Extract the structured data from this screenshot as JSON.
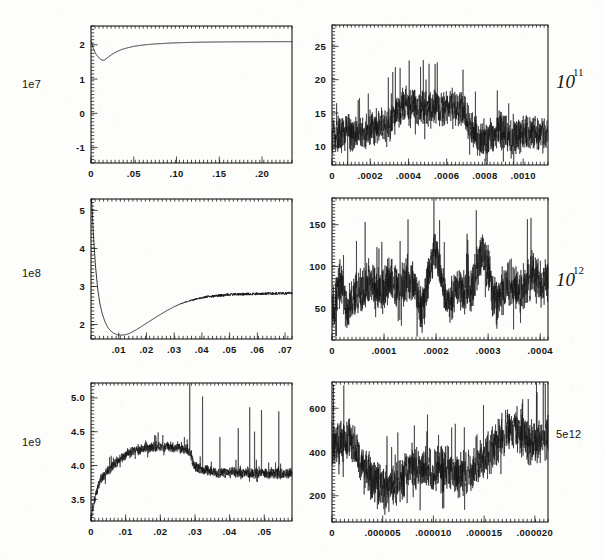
{
  "figure": {
    "background_color": "#fdfdfb",
    "ink_color": "#151515",
    "width": 605,
    "height": 560,
    "panel_count": 6,
    "layout": "3 rows x 2 columns"
  },
  "chart_data": [
    {
      "id": "panel-top-left",
      "type": "line",
      "title": "",
      "xlabel": "",
      "ylabel": "",
      "y_scale_label": "1e7",
      "scale_label_style": "plain",
      "xlim": [
        0,
        0.235
      ],
      "ylim": [
        -1.45,
        2.55
      ],
      "xticks": [
        0,
        0.05,
        0.1,
        0.15,
        0.2
      ],
      "xticklabels": [
        "0",
        ".05",
        ".10",
        ".15",
        ".20"
      ],
      "yticks": [
        -1,
        0,
        1,
        2
      ],
      "yticklabels": [
        "-1",
        "0",
        "1",
        "2"
      ],
      "x_minor_tick_count": 50,
      "y_minor_tick_count": 40,
      "grid": false,
      "legend": false,
      "noise_amplitude": 0.0,
      "x": [
        0.0,
        0.0015,
        0.003,
        0.005,
        0.007,
        0.009,
        0.011,
        0.013,
        0.0145,
        0.016,
        0.018,
        0.021,
        0.025,
        0.03,
        0.036,
        0.043,
        0.05,
        0.058,
        0.067,
        0.077,
        0.088,
        0.1,
        0.115,
        0.13,
        0.15,
        0.17,
        0.19,
        0.21,
        0.225,
        0.235
      ],
      "y": [
        2.12,
        2.0,
        1.88,
        1.76,
        1.69,
        1.63,
        1.58,
        1.555,
        1.55,
        1.56,
        1.6,
        1.66,
        1.73,
        1.8,
        1.865,
        1.915,
        1.955,
        1.985,
        2.01,
        2.03,
        2.045,
        2.06,
        2.07,
        2.078,
        2.084,
        2.088,
        2.09,
        2.092,
        2.093,
        2.094
      ]
    },
    {
      "id": "panel-top-right",
      "type": "line",
      "title": "",
      "xlabel": "",
      "ylabel": "",
      "y_scale_label": "10",
      "y_scale_exponent": "11",
      "scale_label_style": "handwritten-power",
      "xlim": [
        0,
        0.00113
      ],
      "ylim": [
        7.2,
        28.2
      ],
      "xticks": [
        0,
        0.0002,
        0.0004,
        0.0006,
        0.0008,
        0.001
      ],
      "xticklabels": [
        "0",
        ".0002",
        ".0004",
        ".0006",
        ".0008",
        ".0010"
      ],
      "yticks": [
        10,
        15,
        20,
        25
      ],
      "yticklabels": [
        "10",
        "15",
        "20",
        "25"
      ],
      "x_minor_tick_count": 56,
      "y_minor_tick_count": 42,
      "grid": false,
      "legend": false,
      "noise_amplitude": 2.6,
      "envelope_x": [
        0.0,
        5e-05,
        0.0001,
        0.00015,
        0.0002,
        0.00025,
        0.0003,
        0.00034,
        0.00038,
        0.00042,
        0.00048,
        0.00055,
        0.00062,
        0.00068,
        0.00072,
        0.00076,
        0.0008,
        0.00084,
        0.00088,
        0.00092,
        0.00096,
        0.001,
        0.00105,
        0.00113
      ],
      "envelope_y": [
        11.4,
        11.8,
        12.0,
        11.6,
        12.6,
        13.4,
        12.8,
        15.6,
        16.4,
        16.0,
        15.8,
        15.4,
        16.2,
        15.0,
        13.4,
        11.6,
        11.2,
        11.4,
        12.6,
        11.8,
        11.6,
        11.9,
        12.1,
        11.6
      ]
    },
    {
      "id": "panel-middle-left",
      "type": "line",
      "title": "",
      "xlabel": "",
      "ylabel": "",
      "y_scale_label": "1e8",
      "scale_label_style": "plain",
      "xlim": [
        0,
        0.0725
      ],
      "ylim": [
        1.62,
        5.3
      ],
      "xticks": [
        0.01,
        0.02,
        0.03,
        0.04,
        0.05,
        0.06,
        0.07
      ],
      "xticklabels": [
        ".01",
        ".02",
        ".03",
        ".04",
        ".05",
        ".06",
        ".07"
      ],
      "yticks": [
        2,
        3,
        4,
        5
      ],
      "yticklabels": [
        "2",
        "3",
        "4",
        "5"
      ],
      "x_minor_tick_count": 48,
      "y_minor_tick_count": 40,
      "grid": false,
      "legend": false,
      "noise_amplitude": 0.035,
      "noise_start_x": 0.028,
      "x": [
        0.0,
        0.0008,
        0.0016,
        0.0024,
        0.0032,
        0.004,
        0.005,
        0.006,
        0.007,
        0.008,
        0.0095,
        0.011,
        0.0125,
        0.014,
        0.016,
        0.018,
        0.021,
        0.024,
        0.027,
        0.03,
        0.033,
        0.036,
        0.039,
        0.042,
        0.045,
        0.048,
        0.051,
        0.055,
        0.059,
        0.063,
        0.067,
        0.0725
      ],
      "y": [
        5.6,
        4.45,
        3.55,
        2.95,
        2.55,
        2.3,
        2.08,
        1.93,
        1.84,
        1.78,
        1.73,
        1.72,
        1.735,
        1.77,
        1.85,
        1.94,
        2.08,
        2.22,
        2.35,
        2.47,
        2.565,
        2.635,
        2.69,
        2.73,
        2.755,
        2.775,
        2.79,
        2.8,
        2.805,
        2.812,
        2.818,
        2.825
      ]
    },
    {
      "id": "panel-middle-right",
      "type": "line",
      "title": "",
      "xlabel": "",
      "ylabel": "",
      "y_scale_label": "10",
      "y_scale_exponent": "12",
      "scale_label_style": "handwritten-power",
      "xlim": [
        0,
        0.000415
      ],
      "ylim": [
        12,
        182
      ],
      "xticks": [
        0,
        0.0001,
        0.0002,
        0.0003,
        0.0004
      ],
      "xticklabels": [
        "0",
        ".0001",
        ".0002",
        ".0003",
        ".0004"
      ],
      "yticks": [
        50,
        100,
        150
      ],
      "yticklabels": [
        "50",
        "100",
        "150"
      ],
      "x_minor_tick_count": 54,
      "y_minor_tick_count": 44,
      "grid": false,
      "legend": false,
      "noise_amplitude": 26,
      "oscillation_period": 4.65e-05,
      "envelope_x": [
        0.0,
        8e-06,
        1.8e-05,
        2.8e-05,
        3.8e-05,
        4.8e-05,
        5.8e-05,
        7e-05,
        8e-05,
        9e-05,
        0.0001,
        0.00011,
        0.000125,
        0.00014,
        0.000155,
        0.00017,
        0.000185,
        0.0002,
        0.000215,
        0.00023,
        0.000245,
        0.00026,
        0.000275,
        0.00029,
        0.000305,
        0.00032,
        0.000335,
        0.00035,
        0.000365,
        0.00038,
        0.000395,
        0.000415
      ],
      "envelope_y": [
        45,
        52,
        72,
        58,
        70,
        62,
        56,
        82,
        96,
        78,
        62,
        72,
        92,
        84,
        66,
        58,
        88,
        102,
        84,
        66,
        58,
        74,
        94,
        104,
        86,
        70,
        62,
        78,
        88,
        72,
        84,
        98
      ]
    },
    {
      "id": "panel-bottom-left",
      "type": "line",
      "title": "",
      "xlabel": "",
      "ylabel": "",
      "y_scale_label": "1e9",
      "scale_label_style": "plain",
      "xlim": [
        0,
        0.058
      ],
      "ylim": [
        3.18,
        5.22
      ],
      "xticks": [
        0,
        0.01,
        0.02,
        0.03,
        0.04,
        0.05
      ],
      "xticklabels": [
        "0",
        ".01",
        ".02",
        ".03",
        ".04",
        ".05"
      ],
      "yticks": [
        3.5,
        4.0,
        4.5,
        5.0
      ],
      "yticklabels": [
        "3.5",
        "4.0",
        "4.5",
        "5.0"
      ],
      "x_minor_tick_count": 52,
      "y_minor_tick_count": 40,
      "grid": false,
      "legend": false,
      "noise_amplitude": 0.075,
      "spike_x": [
        0.0285,
        0.0322,
        0.0372,
        0.0425,
        0.0458,
        0.0472,
        0.0492,
        0.0542
      ],
      "spike_y": [
        5.35,
        5.02,
        4.42,
        4.55,
        4.86,
        4.5,
        4.82,
        4.8
      ],
      "envelope_x": [
        0.0,
        0.0008,
        0.0016,
        0.0024,
        0.0032,
        0.0045,
        0.006,
        0.0075,
        0.009,
        0.0105,
        0.012,
        0.0135,
        0.015,
        0.017,
        0.019,
        0.021,
        0.023,
        0.0248,
        0.026,
        0.0272,
        0.0285,
        0.0295,
        0.031,
        0.033,
        0.035,
        0.037,
        0.039,
        0.041,
        0.043,
        0.045,
        0.047,
        0.049,
        0.051,
        0.053,
        0.055,
        0.058
      ],
      "envelope_y": [
        3.22,
        3.45,
        3.62,
        3.75,
        3.82,
        3.9,
        3.98,
        4.06,
        4.12,
        4.17,
        4.2,
        4.23,
        4.25,
        4.27,
        4.28,
        4.28,
        4.28,
        4.27,
        4.26,
        4.25,
        4.2,
        4.02,
        3.95,
        3.93,
        3.9,
        3.88,
        3.9,
        3.9,
        3.88,
        3.9,
        3.88,
        3.9,
        3.88,
        3.89,
        3.88,
        3.9
      ]
    },
    {
      "id": "panel-bottom-right",
      "type": "line",
      "title": "",
      "xlabel": "",
      "ylabel": "",
      "y_scale_label": "5e12",
      "scale_label_style": "plain",
      "xlim": [
        0,
        2.13e-05
      ],
      "ylim": [
        80,
        720
      ],
      "xticks": [
        0,
        5e-06,
        1e-05,
        1.5e-05,
        2e-05
      ],
      "xticklabels": [
        "0",
        ".000005",
        ".000010",
        ".000015",
        ".000020"
      ],
      "yticks": [
        200,
        400,
        600
      ],
      "yticklabels": [
        "200",
        "400",
        "600"
      ],
      "x_minor_tick_count": 52,
      "y_minor_tick_count": 40,
      "grid": false,
      "legend": false,
      "noise_amplitude": 95,
      "envelope_x": [
        0.0,
        8e-07,
        1.6e-06,
        2.4e-06,
        3.2e-06,
        4e-06,
        4.8e-06,
        5.6e-06,
        6.4e-06,
        7.2e-06,
        8e-06,
        8.8e-06,
        9.6e-06,
        1.04e-05,
        1.12e-05,
        1.2e-05,
        1.28e-05,
        1.36e-05,
        1.44e-05,
        1.52e-05,
        1.6e-05,
        1.68e-05,
        1.76e-05,
        1.84e-05,
        1.92e-05,
        0.0,
        2.05e-05,
        2.13e-05
      ],
      "envelope_y": [
        430,
        455,
        470,
        400,
        330,
        280,
        245,
        230,
        250,
        300,
        330,
        320,
        310,
        330,
        320,
        300,
        290,
        310,
        330,
        370,
        430,
        480,
        500,
        490,
        470,
        430,
        450,
        470
      ]
    }
  ]
}
